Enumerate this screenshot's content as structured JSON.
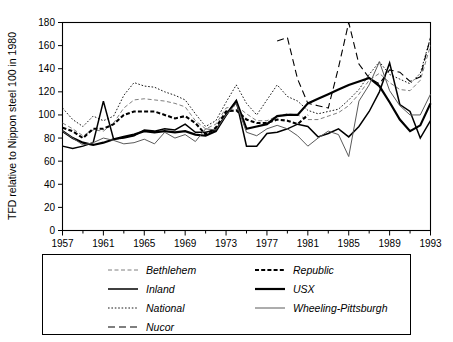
{
  "chart_data": {
    "type": "line",
    "title": "",
    "xlabel": "",
    "ylabel": "TFD relative to Nippon steel 100 in 1980",
    "xlim": [
      1957,
      1993
    ],
    "ylim": [
      0,
      180
    ],
    "ytick_labels": [
      "0",
      "20",
      "40",
      "60",
      "80",
      "100",
      "120",
      "140",
      "160",
      "180"
    ],
    "yticks": [
      0,
      20,
      40,
      60,
      80,
      100,
      120,
      140,
      160,
      180
    ],
    "xtick_labels": [
      "1957",
      "1961",
      "1965",
      "1969",
      "1973",
      "1977",
      "1981",
      "1985",
      "1989",
      "1993"
    ],
    "xticks": [
      1957,
      1961,
      1965,
      1969,
      1973,
      1977,
      1981,
      1985,
      1989,
      1993
    ],
    "xminor_ticks": [
      1959,
      1963,
      1967,
      1971,
      1975,
      1979,
      1983,
      1987,
      1991
    ],
    "grid": false,
    "legend_position": "below",
    "series": [
      {
        "name": "Bethlehem",
        "style": "dashed",
        "color": "#6f6f6f",
        "width": 0.9,
        "dash": "4,2.5",
        "x": [
          1957,
          1958,
          1959,
          1960,
          1961,
          1962,
          1963,
          1964,
          1965,
          1966,
          1967,
          1968,
          1969,
          1970,
          1971,
          1972,
          1973,
          1974,
          1975,
          1976,
          1977,
          1978,
          1979,
          1980,
          1981,
          1982,
          1983,
          1984,
          1985,
          1986,
          1987,
          1988,
          1989,
          1990,
          1991,
          1992,
          1993
        ],
        "values": [
          93,
          88,
          82,
          87,
          86,
          93,
          106,
          113,
          114,
          113,
          112,
          110,
          107,
          95,
          88,
          92,
          106,
          108,
          101,
          95,
          95,
          99,
          101,
          100,
          96,
          96,
          99,
          102,
          108,
          118,
          130,
          136,
          128,
          122,
          121,
          130,
          160
        ]
      },
      {
        "name": "Inland",
        "style": "solid",
        "color": "#000000",
        "width": 1.5,
        "dash": "",
        "x": [
          1957,
          1958,
          1959,
          1960,
          1961,
          1962,
          1963,
          1964,
          1965,
          1966,
          1967,
          1968,
          1969,
          1970,
          1971,
          1972,
          1973,
          1974,
          1975,
          1976,
          1977,
          1978,
          1979,
          1980,
          1981,
          1982,
          1983,
          1984,
          1985,
          1986,
          1987,
          1988,
          1989,
          1990,
          1991,
          1992,
          1993
        ],
        "values": [
          73,
          71,
          73,
          76,
          112,
          79,
          80,
          82,
          87,
          86,
          88,
          87,
          92,
          85,
          85,
          87,
          100,
          112,
          73,
          73,
          84,
          85,
          88,
          92,
          90,
          81,
          84,
          88,
          81,
          90,
          103,
          120,
          145,
          109,
          103,
          80,
          95
        ]
      },
      {
        "name": "National",
        "style": "dotted",
        "color": "#000000",
        "width": 0.9,
        "dash": "1.6,1.8",
        "x": [
          1957,
          1958,
          1959,
          1960,
          1961,
          1962,
          1963,
          1964,
          1965,
          1966,
          1967,
          1968,
          1969,
          1970,
          1971,
          1972,
          1973,
          1974,
          1975,
          1976,
          1977,
          1978,
          1979,
          1980,
          1981,
          1982,
          1983,
          1984,
          1985,
          1986,
          1987,
          1988,
          1989,
          1990,
          1991,
          1992,
          1993
        ],
        "values": [
          106,
          96,
          90,
          99,
          95,
          99,
          117,
          128,
          125,
          124,
          120,
          117,
          113,
          101,
          90,
          95,
          111,
          126,
          110,
          100,
          113,
          126,
          116,
          112,
          104,
          101,
          103,
          105,
          113,
          122,
          135,
          146,
          135,
          131,
          127,
          136,
          167
        ]
      },
      {
        "name": "Nucor",
        "style": "longdash",
        "color": "#000000",
        "width": 1.1,
        "dash": "7,4",
        "x": [
          1978,
          1979,
          1980,
          1981,
          1982,
          1983,
          1984,
          1985,
          1986,
          1987,
          1988,
          1989,
          1990,
          1991,
          1992,
          1993
        ],
        "values": [
          164,
          167,
          131,
          110,
          108,
          106,
          141,
          180,
          144,
          132,
          127,
          139,
          137,
          129,
          133,
          167
        ]
      },
      {
        "name": "Republic",
        "style": "bold-dashed",
        "color": "#000000",
        "width": 2.1,
        "dash": "4,2.2",
        "x": [
          1957,
          1958,
          1959,
          1960,
          1961,
          1962,
          1963,
          1964,
          1965,
          1966,
          1967,
          1968,
          1969,
          1970,
          1971,
          1972,
          1973,
          1974,
          1975,
          1976,
          1977,
          1978,
          1979,
          1980,
          1981
        ],
        "values": [
          89,
          86,
          80,
          88,
          88,
          92,
          100,
          103,
          103,
          103,
          100,
          97,
          99,
          93,
          83,
          89,
          103,
          104,
          96,
          93,
          93,
          96,
          95,
          92,
          100
        ]
      },
      {
        "name": "USX",
        "style": "bold-solid",
        "color": "#000000",
        "width": 2.2,
        "dash": "",
        "x": [
          1957,
          1958,
          1959,
          1960,
          1961,
          1962,
          1963,
          1964,
          1965,
          1966,
          1967,
          1968,
          1969,
          1970,
          1971,
          1972,
          1973,
          1974,
          1975,
          1976,
          1977,
          1978,
          1979,
          1980,
          1981,
          1982,
          1983,
          1984,
          1985,
          1986,
          1987,
          1988,
          1989,
          1990,
          1991,
          1992,
          1993
        ],
        "values": [
          86,
          80,
          76,
          74,
          76,
          79,
          81,
          83,
          86,
          85,
          86,
          85,
          86,
          83,
          82,
          86,
          100,
          112,
          88,
          90,
          92,
          99,
          100,
          100,
          110,
          114,
          118,
          122,
          126,
          129,
          132,
          125,
          111,
          96,
          86,
          91,
          110
        ]
      },
      {
        "name": "Wheeling-Pittsburgh",
        "style": "thin-solid",
        "color": "#5a5a5a",
        "width": 1.0,
        "dash": "",
        "x": [
          1957,
          1958,
          1959,
          1960,
          1961,
          1962,
          1963,
          1964,
          1965,
          1966,
          1967,
          1968,
          1969,
          1970,
          1971,
          1972,
          1973,
          1974,
          1975,
          1976,
          1977,
          1978,
          1979,
          1980,
          1981,
          1982,
          1983,
          1984,
          1985,
          1986,
          1987,
          1988,
          1989,
          1990,
          1991,
          1992,
          1993
        ],
        "values": [
          86,
          80,
          74,
          76,
          80,
          78,
          75,
          76,
          79,
          75,
          85,
          80,
          83,
          77,
          88,
          87,
          100,
          110,
          85,
          82,
          88,
          91,
          88,
          82,
          73,
          80,
          86,
          83,
          64,
          112,
          126,
          146,
          121,
          108,
          100,
          100,
          118
        ]
      }
    ]
  },
  "legend": {
    "entries": [
      {
        "label": "Bethlehem",
        "column": 0,
        "row": 0
      },
      {
        "label": "Inland",
        "column": 0,
        "row": 1
      },
      {
        "label": "National",
        "column": 0,
        "row": 2
      },
      {
        "label": "Nucor",
        "column": 0,
        "row": 3
      },
      {
        "label": "Republic",
        "column": 1,
        "row": 0
      },
      {
        "label": "USX",
        "column": 1,
        "row": 1
      },
      {
        "label": "Wheeling-Pittsburgh",
        "column": 1,
        "row": 2
      }
    ]
  }
}
